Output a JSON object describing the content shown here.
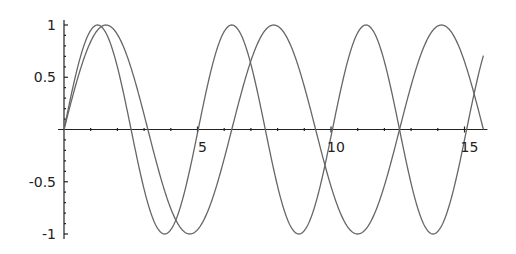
{
  "chart_data": {
    "type": "line",
    "title": "",
    "xlabel": "",
    "ylabel": "",
    "xlim": [
      0,
      15.708
    ],
    "ylim": [
      -1,
      1
    ],
    "grid": false,
    "legend": null,
    "x_ticks": [
      {
        "value": 5,
        "label": "5"
      },
      {
        "value": 10,
        "label": "10"
      },
      {
        "value": 15,
        "label": "15"
      }
    ],
    "y_ticks": [
      {
        "value": 1,
        "label": "1"
      },
      {
        "value": 0.5,
        "label": "0.5"
      },
      {
        "value": -0.5,
        "label": "-0.5"
      },
      {
        "value": -1,
        "label": "-1"
      }
    ],
    "series": [
      {
        "name": "sin(x)",
        "formula": "sin(x)",
        "domain": [
          0,
          15.708
        ],
        "color": "#666666"
      },
      {
        "name": "sin(5x/4)",
        "formula": "sin(1.25x)",
        "domain": [
          0,
          15.708
        ],
        "color": "#666666"
      }
    ]
  }
}
